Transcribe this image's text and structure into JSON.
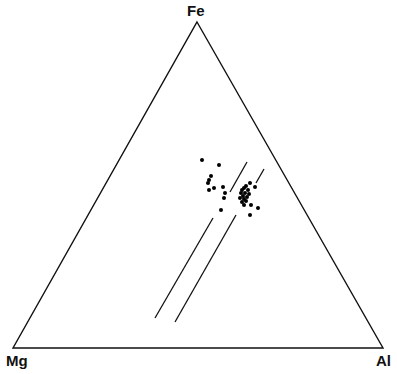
{
  "diagram": {
    "type": "ternary",
    "vertices": {
      "top": {
        "label": "Fe",
        "x": 197,
        "y": 22
      },
      "left": {
        "label": "Mg",
        "x": 13,
        "y": 348
      },
      "right": {
        "label": "Al",
        "x": 383,
        "y": 348
      }
    },
    "line_color": "#111111",
    "point_color": "#000000",
    "tie_lines": [
      {
        "segments": [
          [
            [
              247,
              162
            ],
            [
              230,
              192
            ]
          ],
          [
            [
              213,
              218
            ],
            [
              155,
              318
            ]
          ]
        ]
      },
      {
        "segments": [
          [
            [
              264,
              169
            ],
            [
              256,
              183
            ]
          ],
          [
            [
              236,
              215
            ],
            [
              175,
              322
            ]
          ]
        ]
      }
    ],
    "points": [
      [
        202,
        160
      ],
      [
        219,
        165
      ],
      [
        211,
        176
      ],
      [
        209,
        180
      ],
      [
        208,
        183
      ],
      [
        214,
        188
      ],
      [
        209,
        190
      ],
      [
        223,
        187
      ],
      [
        225,
        193
      ],
      [
        224,
        198
      ],
      [
        221,
        210
      ],
      [
        250,
        183
      ],
      [
        246,
        186
      ],
      [
        244,
        188
      ],
      [
        242,
        190
      ],
      [
        248,
        190
      ],
      [
        241,
        193
      ],
      [
        245,
        193
      ],
      [
        249,
        194
      ],
      [
        243,
        196
      ],
      [
        247,
        197
      ],
      [
        240,
        198
      ],
      [
        244,
        199
      ],
      [
        246,
        201
      ],
      [
        242,
        202
      ],
      [
        255,
        187
      ],
      [
        251,
        205
      ],
      [
        258,
        208
      ],
      [
        250,
        215
      ],
      [
        244,
        205
      ]
    ]
  }
}
